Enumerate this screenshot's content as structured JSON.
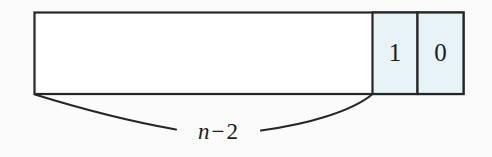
{
  "figure": {
    "background_color": "#fbfbfb",
    "stroke_color": "#262626",
    "cell_fill_color": "#e7f3f6",
    "empty_fill_color": "#ffffff"
  },
  "array": {
    "cells": [
      {
        "name": "span-cell",
        "label": "",
        "filled": false
      },
      {
        "name": "bit-cell-1",
        "label": "1",
        "filled": true
      },
      {
        "name": "bit-cell-0",
        "label": "0",
        "filled": true
      }
    ]
  },
  "brace": {
    "label_variable": "n",
    "label_operator": "−",
    "label_operand": "2",
    "label_full": "n−2"
  }
}
